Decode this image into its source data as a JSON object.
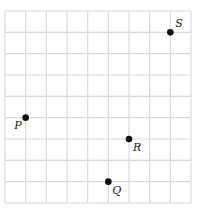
{
  "diagram": {
    "type": "coordinate-grid",
    "columns": 9,
    "rows": 9,
    "gridline_color": "#d9d9d9",
    "point_color": "#111111",
    "points": [
      {
        "label": "S",
        "x": 8,
        "y": 8,
        "label_pos": "upper-right"
      },
      {
        "label": "P",
        "x": 1,
        "y": 4,
        "label_pos": "lower-left"
      },
      {
        "label": "R",
        "x": 6,
        "y": 3,
        "label_pos": "lower-right"
      },
      {
        "label": "Q",
        "x": 5,
        "y": 1,
        "label_pos": "lower-right"
      }
    ]
  }
}
